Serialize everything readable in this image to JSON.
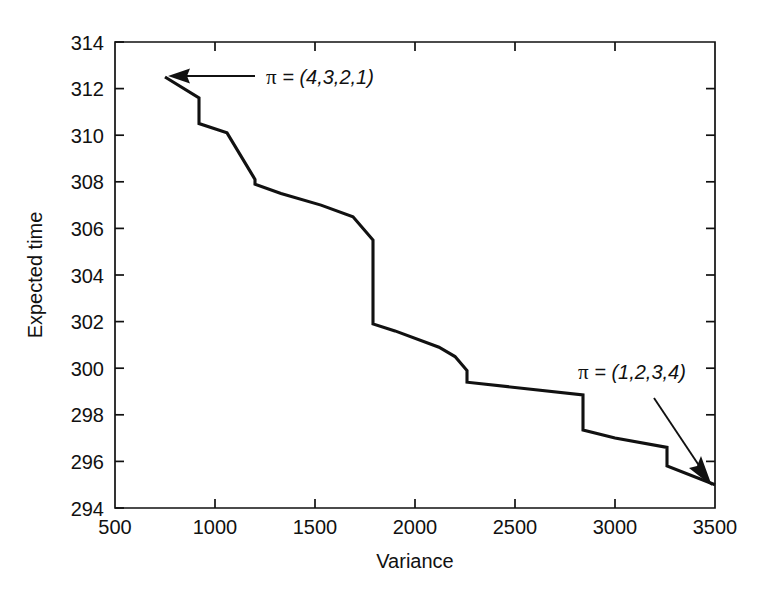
{
  "chart_data": {
    "type": "line",
    "title": "",
    "subtitle": "",
    "xlabel": "Variance",
    "ylabel": "Expected time",
    "xlim": [
      500,
      3500
    ],
    "ylim": [
      294,
      314
    ],
    "xticks": [
      500,
      1000,
      1500,
      2000,
      2500,
      3000,
      3500
    ],
    "xtick_labels": [
      "500",
      "1000",
      "1500",
      "2000",
      "2500",
      "3000",
      "3500"
    ],
    "yticks": [
      294,
      296,
      298,
      300,
      302,
      304,
      306,
      308,
      310,
      312,
      314
    ],
    "ytick_labels": [
      "294",
      "296",
      "298",
      "300",
      "302",
      "304",
      "306",
      "308",
      "310",
      "312",
      "314"
    ],
    "grid": false,
    "legend": null,
    "legend_position": "none",
    "series": [
      {
        "name": "efficient frontier",
        "x": [
          750,
          920,
          920,
          1060,
          1200,
          1200,
          1330,
          1530,
          1690,
          1790,
          1790,
          1900,
          2120,
          2200,
          2260,
          2260,
          2840,
          2840,
          3000,
          3260,
          3260,
          3500
        ],
        "y": [
          312.5,
          311.6,
          310.5,
          310.1,
          308.1,
          307.9,
          307.5,
          307.0,
          306.5,
          305.5,
          301.9,
          301.6,
          300.9,
          300.5,
          299.9,
          299.4,
          298.85,
          297.35,
          297.0,
          296.6,
          295.8,
          295.0
        ]
      }
    ],
    "annotations": [
      {
        "name": "pi-4321",
        "pi_symbol": "π",
        "text": " = (4,3,2,1)",
        "full_text": "π = (4,3,2,1)",
        "points_to_x": 750,
        "points_to_y": 312.5,
        "arrow_style": "horizontal-left"
      },
      {
        "name": "pi-1234",
        "pi_symbol": "π",
        "text": " = (1,2,3,4)",
        "full_text": "π = (1,2,3,4)",
        "points_to_x": 3500,
        "points_to_y": 295.0,
        "arrow_style": "diagonal-down-right"
      }
    ],
    "colors": {
      "line": "#111111",
      "axis": "#111111",
      "background": "#ffffff"
    }
  }
}
